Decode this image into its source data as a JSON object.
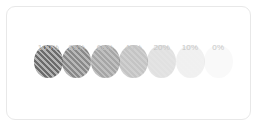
{
  "card": {
    "background": "#ffffff",
    "border_color": "#e8e8e8"
  },
  "legend": {
    "label_color": "#c6c6c6",
    "base_color": "#6b6b6b"
  },
  "chart_data": {
    "type": "bar",
    "title": "",
    "subtitle": "",
    "xlabel": "",
    "ylabel": "",
    "categories": [
      "100%",
      "80%",
      "60%",
      "40%",
      "20%",
      "10%",
      "0%"
    ],
    "values": [
      100,
      80,
      60,
      40,
      20,
      10,
      0
    ],
    "series": [
      {
        "name": "Opacity",
        "values": [
          100,
          80,
          60,
          40,
          20,
          10,
          0
        ]
      }
    ],
    "grid": false,
    "legend_position": "none"
  },
  "swatches": [
    {
      "label": "100%",
      "opacity": 1.0
    },
    {
      "label": "80%",
      "opacity": 0.8
    },
    {
      "label": "60%",
      "opacity": 0.6
    },
    {
      "label": "40%",
      "opacity": 0.4
    },
    {
      "label": "20%",
      "opacity": 0.2
    },
    {
      "label": "10%",
      "opacity": 0.1
    },
    {
      "label": "0%",
      "opacity": 0.04
    }
  ]
}
